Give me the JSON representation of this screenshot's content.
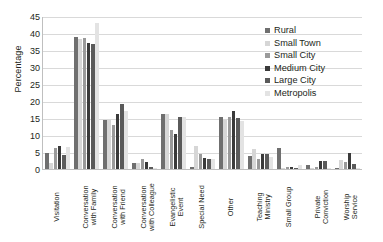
{
  "chart_data": {
    "type": "bar",
    "title": "",
    "xlabel": "",
    "ylabel": "Percentage",
    "ylim": [
      0,
      45
    ],
    "ytick_step": 5,
    "yticks": [
      0,
      5,
      10,
      15,
      20,
      25,
      30,
      35,
      40,
      45
    ],
    "grid": true,
    "legend_position": "top-right",
    "categories": [
      "Visitation",
      "Conversation with Family",
      "Conversation with Colleague",
      "Conversation with Friend",
      "Evangelistic Event",
      "Special Need",
      "Other",
      "Teaching Ministry",
      "Small Group",
      "Private Conviction",
      "Worship Service"
    ],
    "category_lines": [
      [
        "Visitation"
      ],
      [
        "Conversation",
        "with Family"
      ],
      [
        "Conversation",
        "with Friend"
      ],
      [
        "Conversation",
        "with Colleague"
      ],
      [
        "Evangelistic",
        "Event"
      ],
      [
        "Special Need"
      ],
      [
        "Other"
      ],
      [
        "Teaching",
        "Ministry"
      ],
      [
        "Small Group"
      ],
      [
        "Private",
        "Conviction"
      ],
      [
        "Worship",
        "Service"
      ]
    ],
    "display_categories": [
      "Visitation",
      "Conversation with Family",
      "Conversation with Friend",
      "Conversation with Colleague",
      "Evangelistic Event",
      "Special Need",
      "Other",
      "Teaching Ministry",
      "Small Group",
      "Private Conviction",
      "Worship Service"
    ],
    "series": [
      {
        "name": "Rural",
        "color": "#6f6f6f",
        "values": [
          4.7,
          38.7,
          14.3,
          1.9,
          16.3,
          0.6,
          15.2,
          3.9,
          6.2,
          1.3,
          0.2
        ]
      },
      {
        "name": "Small Town",
        "color": "#d6d6d6",
        "values": [
          1.8,
          38.3,
          14.3,
          1.9,
          16.3,
          6.7,
          14.5,
          5.8,
          0.2,
          0.3,
          2.6
        ]
      },
      {
        "name": "Small City",
        "color": "#9a9a9a",
        "values": [
          6.2,
          38.4,
          13.0,
          2.9,
          11.5,
          4.5,
          15.2,
          2.9,
          0.5,
          0.5,
          2.2
        ]
      },
      {
        "name": "Medium City",
        "color": "#3a3a3a",
        "values": [
          6.8,
          37.2,
          16.3,
          2.1,
          10.3,
          3.3,
          17.0,
          4.4,
          0.5,
          2.4,
          4.7
        ]
      },
      {
        "name": "Large City",
        "color": "#5a5a5a",
        "values": [
          4.0,
          36.9,
          19.0,
          0.7,
          15.2,
          3.0,
          15.0,
          4.4,
          0.2,
          2.4,
          1.6
        ]
      },
      {
        "name": "Metropolis",
        "color": "#e3e3e3",
        "values": [
          6.5,
          42.9,
          17.0,
          0.4,
          15.2,
          2.9,
          14.0,
          3.6,
          1.3,
          0.3,
          0.2
        ]
      }
    ]
  },
  "legend": {
    "items": [
      {
        "label": "Rural",
        "color": "#6f6f6f"
      },
      {
        "label": "Small Town",
        "color": "#d6d6d6"
      },
      {
        "label": "Small City",
        "color": "#9a9a9a"
      },
      {
        "label": "Medium City",
        "color": "#3a3a3a"
      },
      {
        "label": "Large City",
        "color": "#5a5a5a"
      },
      {
        "label": "Metropolis",
        "color": "#e3e3e3"
      }
    ]
  }
}
